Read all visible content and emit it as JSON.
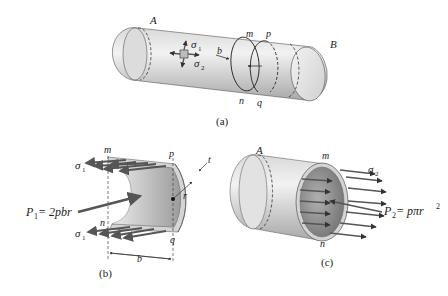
{
  "figure": {
    "panels": [
      {
        "id": "a",
        "caption": "(a)"
      },
      {
        "id": "b",
        "caption": "(b)"
      },
      {
        "id": "c",
        "caption": "(c)"
      }
    ]
  },
  "panel_a": {
    "labels": {
      "A": "A",
      "B": "B",
      "m": "m",
      "n": "n",
      "p": "p",
      "q": "q",
      "b": "b",
      "sigma1": "σ",
      "sigma1_sub": "1",
      "sigma2": "σ",
      "sigma2_sub": "2"
    },
    "caption": "(a)"
  },
  "panel_b": {
    "labels": {
      "m": "m",
      "n": "n",
      "p": "p",
      "q": "q",
      "t": "t",
      "r": "r",
      "b": "b",
      "sigma1_top": "σ",
      "sigma1_top_sub": "1",
      "sigma1_bottom": "σ",
      "sigma1_bottom_sub": "1",
      "force_P": "P",
      "force_sub": "1",
      "force_eq": " = 2pbr"
    },
    "caption": "(b)"
  },
  "panel_c": {
    "labels": {
      "A": "A",
      "m": "m",
      "n": "n",
      "sigma2": "σ",
      "sigma2_sub": "2",
      "force_P": "P",
      "force_sub": "2",
      "force_eq": " = pπr",
      "force_sup": "2"
    },
    "caption": "(c)"
  },
  "colors": {
    "cylinder_light": "#e6e6e6",
    "cylinder_mid": "#c8c8c8",
    "cylinder_dark": "#9a9a9a",
    "inner_dark": "#8a8a8a",
    "arrow": "#555555",
    "line": "#333333"
  }
}
